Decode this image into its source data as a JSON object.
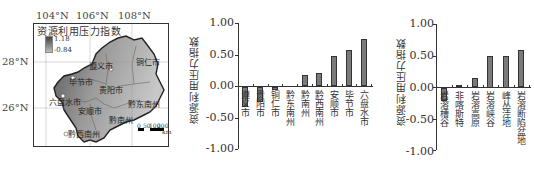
{
  "map": {
    "title": "资源利用压力指数",
    "legend": {
      "max": "1.18",
      "min": "-0.84"
    },
    "lon_labels": [
      "104°N",
      "106°N",
      "108°N"
    ],
    "lat_labels": [
      "28°N",
      "26°N"
    ],
    "regions": [
      "遵义市",
      "毕节市",
      "铜仁市",
      "贵阳市",
      "六盘水市",
      "安顺市",
      "黔东南州",
      "黔南州",
      "黔西南州"
    ],
    "scale": {
      "ticks": [
        "0",
        "50",
        "100",
        "200"
      ],
      "unit": "km"
    }
  },
  "chart_data": [
    {
      "type": "bar",
      "title": "",
      "xlabel": "",
      "ylabel": "资源利用压力指数",
      "ylim": [
        -1.0,
        1.0
      ],
      "yticks": [
        "1.00",
        "0.50",
        "0.00",
        "-0.50",
        "-1.00"
      ],
      "categories": [
        "遵义市",
        "贵阳市",
        "铜仁市",
        "黔东南州",
        "黔南州",
        "黔西南州",
        "安顺市",
        "毕节市",
        "六盘水市"
      ],
      "values": [
        -0.32,
        -0.24,
        -0.04,
        0.0,
        0.17,
        0.21,
        0.48,
        0.57,
        0.74
      ],
      "grid": false
    },
    {
      "type": "bar",
      "title": "",
      "xlabel": "",
      "ylabel": "资源利用压力指数",
      "ylim": [
        -1.0,
        1.0
      ],
      "yticks": [
        "1.00",
        "0.50",
        "0.00",
        "-0.50",
        "-1.00"
      ],
      "categories": [
        "岩溶槽谷",
        "非喀斯特",
        "岩溶高原",
        "岩溶峡谷",
        "峰丛洼地",
        "岩溶断陷盆地"
      ],
      "values": [
        -0.2,
        0.02,
        0.15,
        0.5,
        0.5,
        0.58
      ],
      "grid": false
    }
  ],
  "colors": {
    "bar_fill": "#7a7a7a",
    "bar_edge": "#333333",
    "axis": "#333333"
  }
}
